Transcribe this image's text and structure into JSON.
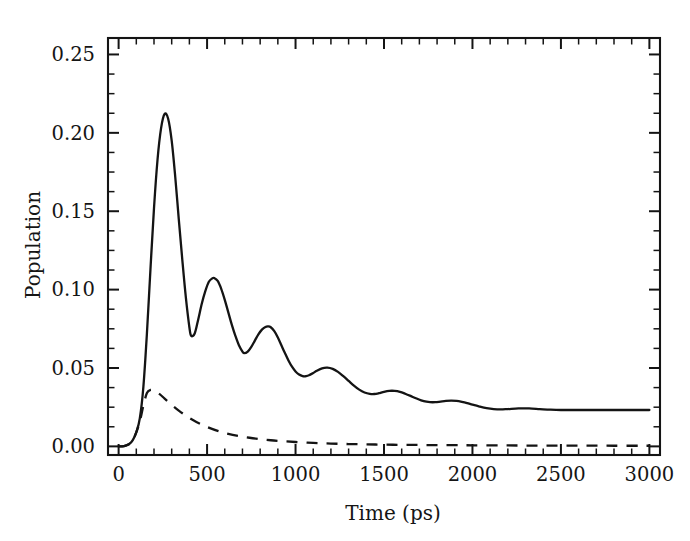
{
  "chart_data": {
    "type": "line",
    "title": "",
    "xlabel": "Time (ps)",
    "ylabel": "Population",
    "xlim": [
      -60,
      3060
    ],
    "ylim": [
      -0.0055,
      0.2605
    ],
    "grid": false,
    "legend": "none",
    "x_ticks": [
      0,
      500,
      1000,
      1500,
      2000,
      2500,
      3000
    ],
    "x_tick_labels": [
      "0",
      "500",
      "1000",
      "1500",
      "2000",
      "2500",
      "3000"
    ],
    "x_minor_step": 100,
    "y_ticks": [
      0.0,
      0.05,
      0.1,
      0.15,
      0.2,
      0.25
    ],
    "y_tick_labels": [
      "0.00",
      "0.05",
      "0.10",
      "0.15",
      "0.20",
      "0.25"
    ],
    "y_minor_step": 0.0125,
    "axis_ticks_direction": "in",
    "frame": "box",
    "series": [
      {
        "name": "solid-curve",
        "style": "solid",
        "color": "#141414",
        "x": [
          0,
          20,
          40,
          60,
          80,
          100,
          120,
          140,
          160,
          180,
          200,
          220,
          240,
          260,
          280,
          300,
          320,
          340,
          360,
          380,
          400,
          410,
          430,
          450,
          470,
          490,
          510,
          530,
          540,
          560,
          580,
          600,
          620,
          640,
          660,
          680,
          700,
          710,
          730,
          750,
          770,
          790,
          810,
          830,
          845,
          860,
          880,
          900,
          920,
          940,
          960,
          980,
          1000,
          1020,
          1040,
          1060,
          1080,
          1100,
          1120,
          1150,
          1180,
          1210,
          1240,
          1270,
          1300,
          1330,
          1360,
          1390,
          1420,
          1445,
          1470,
          1500,
          1530,
          1560,
          1590,
          1620,
          1650,
          1680,
          1710,
          1740,
          1760,
          1790,
          1820,
          1850,
          1880,
          1910,
          1940,
          1970,
          2000,
          2040,
          2080,
          2120,
          2160,
          2200,
          2260,
          2320,
          2380,
          2440,
          2500,
          2600,
          2700,
          2800,
          2900,
          3000
        ],
        "y": [
          0.0,
          0.0,
          0.0005,
          0.0015,
          0.004,
          0.009,
          0.018,
          0.038,
          0.072,
          0.113,
          0.152,
          0.183,
          0.203,
          0.212,
          0.209,
          0.195,
          0.172,
          0.145,
          0.119,
          0.095,
          0.076,
          0.0705,
          0.072,
          0.081,
          0.091,
          0.099,
          0.105,
          0.1072,
          0.1074,
          0.1055,
          0.1005,
          0.0935,
          0.0855,
          0.0775,
          0.0705,
          0.0645,
          0.0605,
          0.0595,
          0.0605,
          0.0635,
          0.0675,
          0.0715,
          0.0745,
          0.0762,
          0.0765,
          0.076,
          0.0735,
          0.0695,
          0.0645,
          0.0595,
          0.0548,
          0.0508,
          0.0478,
          0.0458,
          0.0448,
          0.0448,
          0.0456,
          0.0468,
          0.0482,
          0.0498,
          0.0502,
          0.0494,
          0.0475,
          0.0448,
          0.0418,
          0.0388,
          0.0362,
          0.0344,
          0.0335,
          0.0334,
          0.0339,
          0.0348,
          0.0354,
          0.0354,
          0.0348,
          0.0336,
          0.0322,
          0.0307,
          0.0294,
          0.0285,
          0.0282,
          0.0282,
          0.0286,
          0.029,
          0.0292,
          0.029,
          0.0284,
          0.0276,
          0.0266,
          0.0254,
          0.0244,
          0.0238,
          0.0236,
          0.0238,
          0.0242,
          0.0242,
          0.0238,
          0.0234,
          0.0232,
          0.0232,
          0.0232,
          0.0232,
          0.0232,
          0.0232
        ],
        "y_scale_note": "values above are population units"
      },
      {
        "name": "dashed-curve",
        "style": "dashed",
        "color": "#141414",
        "x": [
          0,
          20,
          40,
          60,
          80,
          100,
          120,
          140,
          160,
          180,
          200,
          230,
          260,
          300,
          340,
          380,
          420,
          460,
          500,
          560,
          620,
          680,
          740,
          800,
          860,
          920,
          1000,
          1100,
          1200,
          1300,
          1400,
          1500,
          1600,
          1700,
          1800,
          1900,
          2000,
          2200,
          2400,
          2600,
          2800,
          3000
        ],
        "y": [
          0.0,
          0.0,
          0.0005,
          0.0015,
          0.004,
          0.009,
          0.016,
          0.026,
          0.034,
          0.036,
          0.0355,
          0.0335,
          0.0305,
          0.0265,
          0.0228,
          0.0196,
          0.0168,
          0.0144,
          0.0124,
          0.0099,
          0.008,
          0.0066,
          0.0055,
          0.0046,
          0.0039,
          0.0034,
          0.0028,
          0.0022,
          0.0018,
          0.0015,
          0.0013,
          0.0011,
          0.001,
          0.0009,
          0.0008,
          0.0008,
          0.0007,
          0.0006,
          0.0005,
          0.0005,
          0.0004,
          0.0004
        ]
      }
    ],
    "annotations": {
      "solid_peaks": [
        {
          "t": 260,
          "population": 0.212
        },
        {
          "t": 540,
          "population": 0.107
        },
        {
          "t": 845,
          "population": 0.0765
        },
        {
          "t": 1150,
          "population": 0.0502
        },
        {
          "t": 1445,
          "population": 0.0354
        },
        {
          "t": 1760,
          "population": 0.0282
        },
        {
          "t": 2080,
          "population": 0.0244
        }
      ],
      "solid_troughs": [
        {
          "t": 410,
          "population": 0.0705
        },
        {
          "t": 710,
          "population": 0.0595
        },
        {
          "t": 1020,
          "population": 0.0448
        },
        {
          "t": 1330,
          "population": 0.0334
        },
        {
          "t": 1650,
          "population": 0.0282
        }
      ],
      "dashed_peak": {
        "t": 180,
        "population": 0.036
      }
    }
  },
  "axes": {
    "x_label": "Time (ps)",
    "y_label": "Population"
  }
}
